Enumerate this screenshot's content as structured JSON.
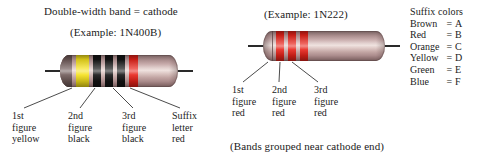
{
  "figure": {
    "title_left": "Double-width band = cathode",
    "example_left": "(Example: 1N400B)",
    "example_right": "(Example: 1N222)",
    "caption_right": "(Bands grouped near cathode end)"
  },
  "diode_left": {
    "name": "diode-1n400b",
    "body_color": "#c9a9a7",
    "bands": [
      {
        "name": "cathode-band",
        "color": "#6f5a58",
        "label": "cathode",
        "double_width": true
      },
      {
        "name": "band-1",
        "color": "#f5e11c",
        "label": "yellow"
      },
      {
        "name": "band-2",
        "color": "#141414",
        "label": "black"
      },
      {
        "name": "band-3",
        "color": "#141414",
        "label": "black"
      },
      {
        "name": "band-4",
        "color": "#e8231a",
        "label": "red"
      }
    ],
    "callouts": [
      {
        "line1": "1st",
        "line2": "figure",
        "line3": "yellow"
      },
      {
        "line1": "2nd",
        "line2": "figure",
        "line3": "black"
      },
      {
        "line1": "3rd",
        "line2": "figure",
        "line3": "black"
      },
      {
        "line1": "Suffix",
        "line2": "letter",
        "line3": "red"
      }
    ]
  },
  "diode_right": {
    "name": "diode-1n222",
    "body_color": "#c9a9a7",
    "bands": [
      {
        "name": "band-1",
        "color": "#e8231a",
        "label": "red"
      },
      {
        "name": "band-2",
        "color": "#e8231a",
        "label": "red"
      },
      {
        "name": "band-3",
        "color": "#e8231a",
        "label": "red"
      }
    ],
    "callouts": [
      {
        "line1": "1st",
        "line2": "figure",
        "line3": "red"
      },
      {
        "line1": "2nd",
        "line2": "figure",
        "line3": "red"
      },
      {
        "line1": "3rd",
        "line2": "figure",
        "line3": "red"
      }
    ]
  },
  "suffix_table": {
    "heading": "Suffix colors",
    "rows": [
      {
        "color": "Brown",
        "eq": "=",
        "letter": "A",
        "swatch": "#7a4a22"
      },
      {
        "color": "Red",
        "eq": "=",
        "letter": "B",
        "swatch": "#e8231a"
      },
      {
        "color": "Orange",
        "eq": "=",
        "letter": "C",
        "swatch": "#e87a1a"
      },
      {
        "color": "Yellow",
        "eq": "=",
        "letter": "D",
        "swatch": "#f5e11c"
      },
      {
        "color": "Green",
        "eq": "=",
        "letter": "E",
        "swatch": "#3a9a4a"
      },
      {
        "color": "Blue",
        "eq": "=",
        "letter": "F",
        "swatch": "#2a4a9a"
      }
    ]
  }
}
